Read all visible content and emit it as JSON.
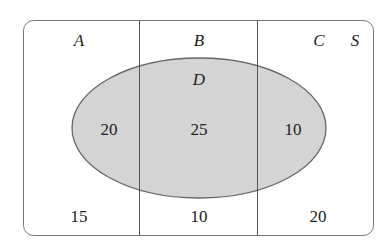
{
  "diagram": {
    "type": "venn",
    "universal_set": "S",
    "partition_sets": [
      "A",
      "B",
      "C"
    ],
    "oval_set": "D",
    "labels": {
      "A": "A",
      "B": "B",
      "C": "C",
      "S": "S",
      "D": "D"
    },
    "regions": {
      "A_and_D": "20",
      "B_and_D": "25",
      "C_and_D": "10",
      "A_not_D": "15",
      "B_not_D": "10",
      "C_not_D": "20"
    },
    "colors": {
      "oval_fill": "#d4d4d4",
      "stroke": "#666666",
      "background": "#ffffff"
    }
  }
}
